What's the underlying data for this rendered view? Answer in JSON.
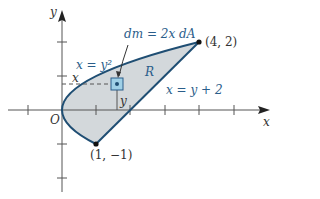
{
  "diagram": {
    "axes": {
      "x_label": "x",
      "y_label": "y",
      "origin_label": "O",
      "x_ticks": [
        -1,
        1,
        2,
        3,
        4,
        5
      ],
      "y_ticks": [
        -2,
        -1,
        1,
        2
      ]
    },
    "curves": [
      {
        "name": "parabola",
        "equation": "x = y²"
      },
      {
        "name": "line",
        "equation": "x = y + 2"
      }
    ],
    "region_label": "R",
    "element_label": "dm = 2x dA",
    "element_x_label": "x",
    "element_y_label": "y",
    "points": [
      {
        "label": "(4, 2)",
        "x": 4,
        "y": 2
      },
      {
        "label": "(1, −1)",
        "x": 1,
        "y": -1
      }
    ],
    "colors": {
      "curve": "#1f4e73",
      "fill": "#d3d8db",
      "label": "#2a5d8a",
      "element_fill": "#9fd0e6",
      "axis": "#444444"
    }
  }
}
